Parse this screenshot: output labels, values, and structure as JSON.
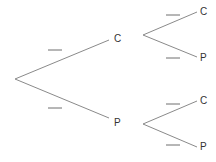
{
  "diagram": {
    "type": "probability-tree",
    "colors": {
      "line": "#8a8a8a",
      "blank": "#6e6e6e",
      "text": "#333333"
    },
    "level1": [
      {
        "label": "C",
        "probability": ""
      },
      {
        "label": "P",
        "probability": ""
      }
    ],
    "level2": {
      "after_C": [
        {
          "label": "C",
          "probability": ""
        },
        {
          "label": "P",
          "probability": ""
        }
      ],
      "after_P": [
        {
          "label": "C",
          "probability": ""
        },
        {
          "label": "P",
          "probability": ""
        }
      ]
    }
  }
}
